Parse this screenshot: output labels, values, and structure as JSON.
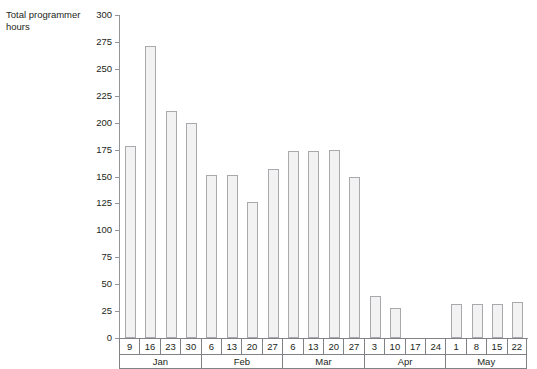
{
  "chart_data": {
    "type": "bar",
    "title": "",
    "xlabel": "",
    "ylabel": "Total programmer\nhours",
    "ylim": [
      0,
      300
    ],
    "yticks": [
      0,
      25,
      50,
      75,
      100,
      125,
      150,
      175,
      200,
      225,
      250,
      275,
      300
    ],
    "ytick_labels": [
      "0",
      "25",
      "50",
      "75",
      "100",
      "125",
      "150",
      "175",
      "200",
      "225",
      "250",
      "275",
      "300"
    ],
    "grid": false,
    "legend": null,
    "bar_fill_color": "#f2f2f2",
    "bar_edge_color": "#a7a9ac",
    "axis_color": "#939598",
    "categories": [
      "9",
      "16",
      "23",
      "30",
      "6",
      "13",
      "20",
      "27",
      "6",
      "13",
      "20",
      "27",
      "3",
      "10",
      "17",
      "24",
      "1",
      "8",
      "15",
      "22"
    ],
    "values": [
      178,
      271,
      211,
      200,
      151,
      151,
      126,
      157,
      174,
      174,
      175,
      150,
      39,
      28,
      0,
      0,
      32,
      32,
      32,
      33
    ],
    "groups": [
      {
        "label": "Jan",
        "days": [
          "9",
          "16",
          "23",
          "30"
        ],
        "values": [
          178,
          271,
          211,
          200
        ]
      },
      {
        "label": "Feb",
        "days": [
          "6",
          "13",
          "20",
          "27"
        ],
        "values": [
          151,
          151,
          126,
          157
        ]
      },
      {
        "label": "Mar",
        "days": [
          "6",
          "13",
          "20",
          "27"
        ],
        "values": [
          174,
          174,
          175,
          150
        ]
      },
      {
        "label": "Apr",
        "days": [
          "3",
          "10",
          "17",
          "24"
        ],
        "values": [
          39,
          28,
          0,
          0
        ]
      },
      {
        "label": "May",
        "days": [
          "1",
          "8",
          "15",
          "22"
        ],
        "values": [
          32,
          32,
          32,
          33
        ]
      }
    ]
  }
}
